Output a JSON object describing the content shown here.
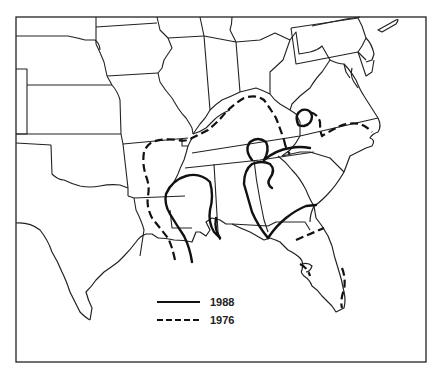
{
  "map": {
    "region": "Southeastern United States",
    "colors": {
      "background": "#ffffff",
      "lines": "#111111"
    },
    "legend": {
      "items": [
        {
          "label": "1988",
          "style": "solid"
        },
        {
          "label": "1976",
          "style": "dashed"
        }
      ]
    }
  }
}
